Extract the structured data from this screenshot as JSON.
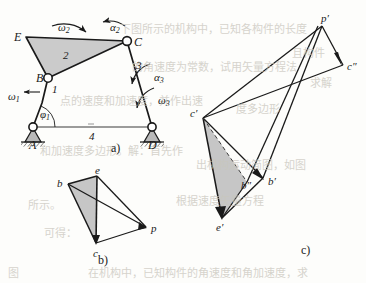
{
  "figure": {
    "caption_a": "a)",
    "caption_b": "b)",
    "caption_c": "c)",
    "colors": {
      "line": "#1a1a1a",
      "shade": "#c8c8c8",
      "ground_hatch": "#5a5a5a",
      "paper": "#fdfdfb",
      "bleed_text": "#c9c6bd"
    }
  },
  "mechanism": {
    "name": "four-bar-linkage",
    "joints": [
      {
        "id": "A",
        "label": "A",
        "x": 33,
        "y": 127,
        "type": "fixed-pivot"
      },
      {
        "id": "B",
        "label": "B",
        "x": 48,
        "y": 78,
        "type": "pin-joint"
      },
      {
        "id": "C",
        "label": "C",
        "x": 127,
        "y": 41,
        "type": "pin-joint"
      },
      {
        "id": "D",
        "label": "D",
        "x": 152,
        "y": 127,
        "type": "fixed-pivot"
      },
      {
        "id": "E",
        "label": "E",
        "x": 26,
        "y": 37,
        "type": "vertex"
      }
    ],
    "links": [
      {
        "id": "1",
        "label": "1",
        "from": "A",
        "to": "B"
      },
      {
        "id": "2",
        "label": "2",
        "from": "B",
        "to": "C",
        "shape": "triangle B-C-E",
        "shaded": true
      },
      {
        "id": "3",
        "label": "3",
        "from": "C",
        "to": "D"
      },
      {
        "id": "4",
        "label": "4",
        "from": "A",
        "to": "D",
        "type": "frame"
      }
    ],
    "annotations": [
      {
        "id": "omega1",
        "base": "ω",
        "sub": "1",
        "x": 8,
        "y": 91
      },
      {
        "id": "phi1",
        "base": "φ",
        "sub": "1",
        "x": 40,
        "y": 109
      },
      {
        "id": "omega2",
        "base": "ω",
        "sub": "2",
        "x": 58,
        "y": 22
      },
      {
        "id": "alpha2",
        "base": "α",
        "sub": "2",
        "x": 110,
        "y": 22
      },
      {
        "id": "alpha3",
        "base": "α",
        "sub": "3",
        "x": 154,
        "y": 72
      },
      {
        "id": "omega3",
        "base": "ω",
        "sub": "3",
        "x": 158,
        "y": 95
      }
    ]
  },
  "velocity_polygon": {
    "name": "velocity-diagram",
    "points": [
      {
        "id": "b",
        "label": "b",
        "x": 68,
        "y": 184
      },
      {
        "id": "e",
        "label": "e",
        "x": 97,
        "y": 176
      },
      {
        "id": "c",
        "label": "c",
        "x": 96,
        "y": 243
      },
      {
        "id": "p",
        "label": "p",
        "x": 146,
        "y": 227
      }
    ],
    "shaded_triangle": [
      "b",
      "e",
      "c"
    ]
  },
  "acceleration_polygon": {
    "name": "acceleration-diagram",
    "points": [
      {
        "id": "cp",
        "label": "c′",
        "x": 203,
        "y": 118
      },
      {
        "id": "pp",
        "label": "p′",
        "x": 322,
        "y": 26
      },
      {
        "id": "cpp",
        "label": "c″",
        "x": 343,
        "y": 65
      },
      {
        "id": "bp",
        "label": "b′",
        "x": 263,
        "y": 178
      },
      {
        "id": "bpp",
        "label": "b″",
        "x": 247,
        "y": 182
      },
      {
        "id": "ep",
        "label": "e′",
        "x": 222,
        "y": 218
      }
    ],
    "shaded_triangle": [
      "cp",
      "bpp",
      "ep"
    ],
    "dashed_edge": [
      "cp",
      "bpp"
    ]
  },
  "bleed_text": [
    {
      "text": "下图所示的机构中，已知各构件的长度",
      "x": 120,
      "y": 24,
      "size": 11
    },
    {
      "text": "且构件",
      "x": 292,
      "y": 48,
      "size": 11
    },
    {
      "text": "的角速度为常数，试用矢量方程法",
      "x": 132,
      "y": 62,
      "size": 11
    },
    {
      "text": "求解",
      "x": 310,
      "y": 78,
      "size": 11
    },
    {
      "text": "点的速度和加速度，并作出速",
      "x": 60,
      "y": 96,
      "size": 11
    },
    {
      "text": "度多边形",
      "x": 236,
      "y": 104,
      "size": 11
    },
    {
      "text": "和加速度多边形。解：首先作",
      "x": 40,
      "y": 146,
      "size": 11
    },
    {
      "text": "出机构运动简图，如图",
      "x": 196,
      "y": 160,
      "size": 11
    },
    {
      "text": "所示。",
      "x": 28,
      "y": 200,
      "size": 11
    },
    {
      "text": "根据速度矢量方程",
      "x": 176,
      "y": 196,
      "size": 11
    },
    {
      "text": "可得：",
      "x": 44,
      "y": 228,
      "size": 11
    },
    {
      "text": "在机构中，已知构件的角速度和角加速度，求",
      "x": 88,
      "y": 268,
      "size": 11
    },
    {
      "text": "图",
      "x": 8,
      "y": 268,
      "size": 11
    }
  ]
}
